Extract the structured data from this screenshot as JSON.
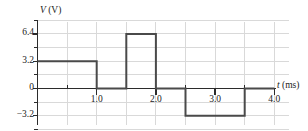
{
  "chart_data": {
    "type": "line",
    "title": "",
    "ylabel": "V (V)",
    "ylabel_symbol": "V",
    "ylabel_unit": "(V)",
    "xlabel": "t (ms)",
    "xlabel_symbol": "t",
    "xlabel_unit": "(ms)",
    "xlim": [
      0,
      4.25
    ],
    "ylim": [
      -4.8,
      8.0
    ],
    "grid": true,
    "grid_x_step": 0.5,
    "grid_y_step": 1.6,
    "legend": "none",
    "xticks": [
      {
        "value": 1.0,
        "label": "1.0"
      },
      {
        "value": 2.0,
        "label": "2.0"
      },
      {
        "value": 3.0,
        "label": "3.0"
      },
      {
        "value": 4.0,
        "label": "4.0"
      }
    ],
    "xminor_ticks": [
      0.5,
      1.5,
      2.5,
      3.5
    ],
    "yticks": [
      {
        "value": 6.4,
        "label": "6.4"
      },
      {
        "value": 3.2,
        "label": "3.2"
      },
      {
        "value": 0,
        "label": "0"
      },
      {
        "value": -3.2,
        "label": "−3.2"
      }
    ],
    "yminor_ticks": [
      8.0,
      4.8,
      1.6,
      -1.6,
      -4.8
    ],
    "series": [
      {
        "name": "v(t)",
        "color": "#4a4a4a",
        "segments": [
          {
            "t_start": 0.0,
            "t_end": 1.0,
            "value": 3.2
          },
          {
            "t_start": 1.0,
            "t_end": 1.5,
            "value": 0.0
          },
          {
            "t_start": 1.5,
            "t_end": 2.0,
            "value": 6.4
          },
          {
            "t_start": 2.0,
            "t_end": 2.5,
            "value": 0.0
          },
          {
            "t_start": 2.5,
            "t_end": 3.5,
            "value": -3.2
          },
          {
            "t_start": 3.5,
            "t_end": 4.0,
            "value": 0.0
          }
        ],
        "points": [
          {
            "t": 0.0,
            "v": 3.2
          },
          {
            "t": 1.0,
            "v": 3.2
          },
          {
            "t": 1.0,
            "v": 0.0
          },
          {
            "t": 1.5,
            "v": 0.0
          },
          {
            "t": 1.5,
            "v": 6.4
          },
          {
            "t": 2.0,
            "v": 6.4
          },
          {
            "t": 2.0,
            "v": 0.0
          },
          {
            "t": 2.5,
            "v": 0.0
          },
          {
            "t": 2.5,
            "v": -3.2
          },
          {
            "t": 3.5,
            "v": -3.2
          },
          {
            "t": 3.5,
            "v": 0.0
          },
          {
            "t": 4.0,
            "v": 0.0
          }
        ]
      }
    ],
    "colors": {
      "waveform": "#4a4a4a",
      "axis": "#2b2b2b",
      "grid": "#d9d9d9",
      "background": "#ffffff",
      "text": "#222222"
    }
  }
}
